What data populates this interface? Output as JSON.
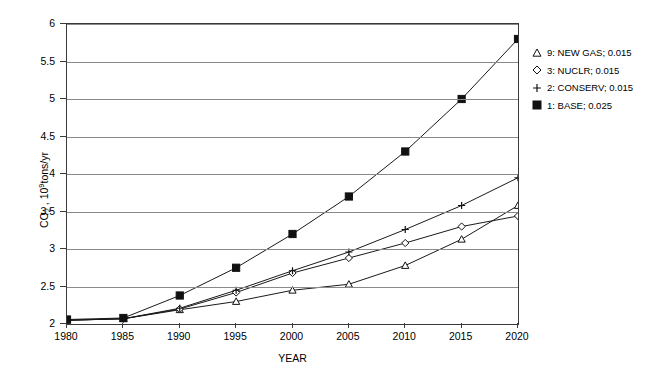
{
  "chart_data": {
    "type": "line",
    "title": "",
    "xlabel": "YEAR",
    "ylabel": "CO2 , 10^9 tons/yr",
    "x": [
      1980,
      1985,
      1990,
      1995,
      2000,
      2005,
      2010,
      2015,
      2020
    ],
    "xticklabels": [
      "1980",
      "1985",
      "1990",
      "1995",
      "2000",
      "2005",
      "2010",
      "2015",
      "2020"
    ],
    "yticklabels": [
      "2",
      "2.5",
      "3",
      "3.5",
      "4",
      "4.5",
      "5",
      "5.5",
      "6"
    ],
    "yticks": [
      2,
      2.5,
      3,
      3.5,
      4,
      4.5,
      5,
      5.5,
      6
    ],
    "xlim": [
      1980,
      2020
    ],
    "ylim": [
      2,
      6
    ],
    "grid": "horizontal",
    "legend_position": "right",
    "series": [
      {
        "name": "9: NEW GAS; 0.015",
        "marker": "open-triangle",
        "values": [
          2.05,
          2.07,
          2.19,
          2.3,
          2.45,
          2.53,
          2.78,
          3.13,
          3.58
        ]
      },
      {
        "name": "3: NUCLR; 0.015",
        "marker": "open-diamond",
        "values": [
          2.05,
          2.07,
          2.2,
          2.42,
          2.68,
          2.88,
          3.08,
          3.3,
          3.44
        ]
      },
      {
        "name": "2: CONSERV; 0.015",
        "marker": "plus",
        "values": [
          2.05,
          2.07,
          2.21,
          2.45,
          2.71,
          2.96,
          3.26,
          3.58,
          3.95
        ]
      },
      {
        "name": "1: BASE; 0.025",
        "marker": "filled-square",
        "values": [
          2.06,
          2.08,
          2.38,
          2.75,
          3.2,
          3.7,
          4.3,
          5.0,
          5.8
        ]
      }
    ]
  },
  "legend": {
    "items": [
      {
        "marker": "open-triangle",
        "label": "9: NEW GAS; 0.015"
      },
      {
        "marker": "open-diamond",
        "label": "3: NUCLR; 0.015"
      },
      {
        "marker": "plus",
        "label": "2: CONSERV; 0.015"
      },
      {
        "marker": "filled-square",
        "label": "1: BASE; 0.025"
      }
    ]
  },
  "axes": {
    "y_title_parts": {
      "species": "CO",
      "sub": "2",
      "mid": " , 10",
      "sup": "9",
      "units": "tons/yr"
    },
    "x_title": "YEAR"
  },
  "colors": {
    "line": "#1a1a1a",
    "grid": "#8a8a8a",
    "frame": "#3a3a3a"
  }
}
